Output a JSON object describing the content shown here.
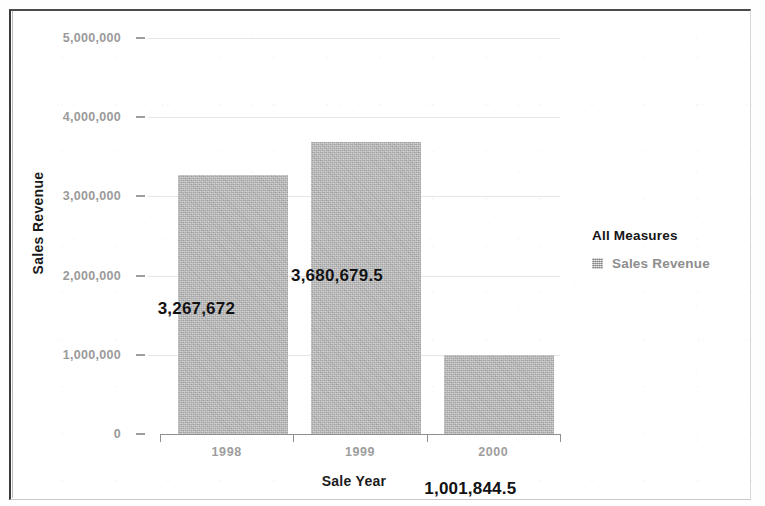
{
  "chart_data": {
    "type": "bar",
    "title": "",
    "xlabel": "Sale Year",
    "ylabel": "Sales Revenue",
    "categories": [
      "1998",
      "1999",
      "2000"
    ],
    "values": [
      3267672,
      3680679.5,
      1001844.5
    ],
    "value_labels": [
      "3,267,672",
      "3,680,679.5",
      "1,001,844.5"
    ],
    "series": [
      {
        "name": "Sales Revenue",
        "values": [
          3267672,
          3680679.5,
          1001844.5
        ]
      }
    ],
    "ylim": [
      0,
      5000000
    ],
    "ytick_values": [
      0,
      1000000,
      2000000,
      3000000,
      4000000,
      5000000
    ],
    "ytick_labels": [
      "0",
      "1,000,000",
      "2,000,000",
      "3,000,000",
      "4,000,000",
      "5,000,000"
    ],
    "grid": true,
    "legend_position": "right",
    "legend_title": "All Measures",
    "legend_entries": [
      "Sales Revenue"
    ],
    "bar_color": "#b2b2b2",
    "label_color": "#121212",
    "tick_color": "#9a9a9a",
    "axis_title_color": "#1b1b1b"
  },
  "axes": {
    "y_title": "Sales Revenue",
    "x_title": "Sale Year"
  },
  "legend": {
    "title": "All Measures",
    "items": [
      {
        "label": "Sales Revenue",
        "swatch_color": "#b8b8b8"
      }
    ]
  }
}
